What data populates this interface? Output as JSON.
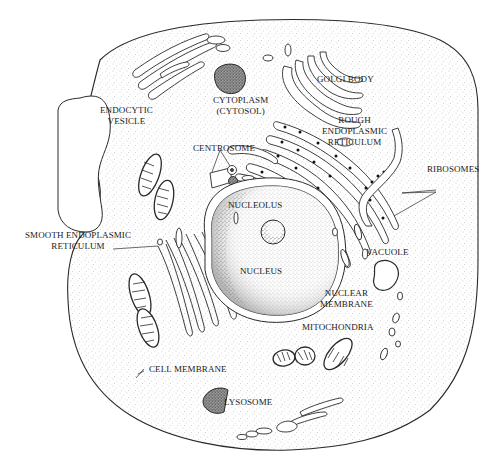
{
  "colors": {
    "line": "#2a2a2a",
    "stipple": "#9a9a9a",
    "dark_stipple": "#5a5a5a",
    "background": "#ffffff"
  },
  "labels": {
    "golgi_body": "GOLGI BODY",
    "cytoplasm_1": "CYTOPLASM",
    "cytoplasm_2": "(CYTOSOL)",
    "rough_er_1": "ROUGH",
    "rough_er_2": "ENDOPLASMIC",
    "rough_er_3": "RETICULUM",
    "endocytic_1": "ENDOCYTIC",
    "endocytic_2": "VESICLE",
    "centrosome": "CENTROSOME",
    "ribosomes": "RIBOSOMES",
    "nucleolus": "NUCLEOLUS",
    "smooth_er_1": "SMOOTH ENDOPLASMIC",
    "smooth_er_2": "RETICULUM",
    "nucleus": "NUCLEUS",
    "vacuole": "VACUOLE",
    "nuclear_membrane_1": "NUCLEAR",
    "nuclear_membrane_2": "MEMBRANE",
    "mitochondria": "MITOCHONDRIA",
    "cell_membrane": "CELL MEMBRANE",
    "lysosome": "LYSOSOME"
  }
}
